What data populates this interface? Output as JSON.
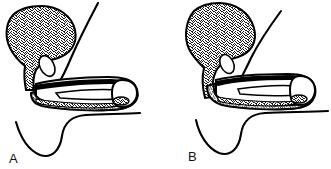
{
  "figure": {
    "background_color": "#ffffff",
    "ink_color": "#000000",
    "stipple_color": "#1a1a1a",
    "panels": [
      {
        "id": "panel-a",
        "label": "A",
        "label_x": 9,
        "label_y": 163,
        "description": "Left sagittal view: stippled bladder-like bulbous structure with tapering neck, small oval utricle, elongated shaft with dark band and stippled spongiosum band, rounded glans tip, and lower perineal scrotal contour."
      },
      {
        "id": "panel-b",
        "label": "B",
        "label_x": 188,
        "label_y": 161,
        "description": "Right sagittal view: same structures with the stippled band continuing further around the bulb and along the ventral shaft."
      }
    ],
    "structures": [
      {
        "name": "bulbous-stippled-body",
        "fill": "stipple"
      },
      {
        "name": "oval-utricle",
        "fill": "white"
      },
      {
        "name": "dorsal-curved-line",
        "fill": "none"
      },
      {
        "name": "shaft-outline",
        "fill": "white"
      },
      {
        "name": "dark-band",
        "fill": "#000000"
      },
      {
        "name": "stippled-spongiosum-band",
        "fill": "stipple"
      },
      {
        "name": "glans-tip",
        "fill": "white"
      },
      {
        "name": "perineal-scrotal-contour",
        "fill": "none"
      }
    ]
  }
}
